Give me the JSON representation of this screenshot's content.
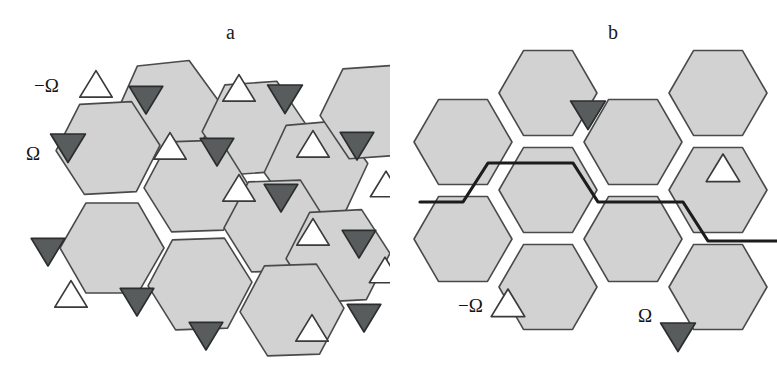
{
  "figure": {
    "width": 777,
    "height": 372,
    "background": "#ffffff"
  },
  "colors": {
    "hexagon_fill": "#d2d2d2",
    "hexagon_stroke": "#4a4a4a",
    "bold_edge_stroke": "#1c1c1c",
    "triangle_dark_fill": "#585c5c",
    "triangle_dark_stroke": "#2b2e2e",
    "triangle_light_fill": "#ffffff",
    "triangle_light_stroke": "#3a3a3a",
    "text": "#141414"
  },
  "panels": [
    {
      "id": "a",
      "label": "a",
      "label_x": 226,
      "label_y": 22,
      "legend": [
        {
          "name": "minus-omega",
          "text": "−Ω",
          "x": 34,
          "y": 88,
          "marker": "up-light"
        },
        {
          "name": "plus-omega",
          "text": "Ω",
          "x": 26,
          "y": 156,
          "marker": "down-dark"
        }
      ],
      "hexagons": [
        {
          "id": "a-h1",
          "cx": 168,
          "cy": 108,
          "r": 52,
          "rot": -6
        },
        {
          "id": "a-h2",
          "cx": 108,
          "cy": 148,
          "r": 52,
          "rot": -3
        },
        {
          "id": "a-h3",
          "cx": 254,
          "cy": 128,
          "r": 52,
          "rot": -4
        },
        {
          "id": "a-h4",
          "cx": 196,
          "cy": 186,
          "r": 52,
          "rot": -2
        },
        {
          "id": "a-h5",
          "cx": 316,
          "cy": 168,
          "r": 52,
          "rot": -5
        },
        {
          "id": "a-h6",
          "cx": 276,
          "cy": 226,
          "r": 52,
          "rot": -2
        },
        {
          "id": "a-h7",
          "cx": 112,
          "cy": 248,
          "r": 52,
          "rot": 0
        },
        {
          "id": "a-h8",
          "cx": 200,
          "cy": 284,
          "r": 52,
          "rot": -2
        },
        {
          "id": "a-h9",
          "cx": 338,
          "cy": 256,
          "r": 52,
          "rot": -3
        },
        {
          "id": "a-h10",
          "cx": 292,
          "cy": 310,
          "r": 52,
          "rot": -2
        },
        {
          "id": "a-h11",
          "cx": 372,
          "cy": 112,
          "r": 52,
          "rot": -4
        }
      ],
      "triangles": [
        {
          "id": "a-t1",
          "cx": 96,
          "cy": 86,
          "dir": "up",
          "tone": "light",
          "size": 27
        },
        {
          "id": "a-t2",
          "cx": 146,
          "cy": 98,
          "dir": "down",
          "tone": "dark",
          "size": 28
        },
        {
          "id": "a-t3",
          "cx": 239,
          "cy": 90,
          "dir": "up",
          "tone": "light",
          "size": 27
        },
        {
          "id": "a-t4",
          "cx": 285,
          "cy": 97,
          "dir": "down",
          "tone": "dark",
          "size": 29
        },
        {
          "id": "a-t5",
          "cx": 68,
          "cy": 146,
          "dir": "down",
          "tone": "dark",
          "size": 29
        },
        {
          "id": "a-t6",
          "cx": 170,
          "cy": 148,
          "dir": "up",
          "tone": "light",
          "size": 27
        },
        {
          "id": "a-t7",
          "cx": 217,
          "cy": 150,
          "dir": "down",
          "tone": "dark",
          "size": 28
        },
        {
          "id": "a-t8",
          "cx": 313,
          "cy": 146,
          "dir": "up",
          "tone": "light",
          "size": 27
        },
        {
          "id": "a-t9",
          "cx": 357,
          "cy": 144,
          "dir": "down",
          "tone": "dark",
          "size": 28
        },
        {
          "id": "a-t10",
          "cx": 239,
          "cy": 190,
          "dir": "up",
          "tone": "light",
          "size": 27
        },
        {
          "id": "a-t11",
          "cx": 281,
          "cy": 196,
          "dir": "down",
          "tone": "dark",
          "size": 28
        },
        {
          "id": "a-t12",
          "cx": 386,
          "cy": 186,
          "dir": "up",
          "tone": "light",
          "size": 26
        },
        {
          "id": "a-t13",
          "cx": 313,
          "cy": 234,
          "dir": "up",
          "tone": "light",
          "size": 27
        },
        {
          "id": "a-t14",
          "cx": 359,
          "cy": 242,
          "dir": "down",
          "tone": "dark",
          "size": 28
        },
        {
          "id": "a-t15",
          "cx": 48,
          "cy": 250,
          "dir": "down",
          "tone": "dark",
          "size": 28
        },
        {
          "id": "a-t16",
          "cx": 385,
          "cy": 272,
          "dir": "up",
          "tone": "light",
          "size": 26
        },
        {
          "id": "a-t17",
          "cx": 71,
          "cy": 296,
          "dir": "up",
          "tone": "light",
          "size": 27
        },
        {
          "id": "a-t18",
          "cx": 137,
          "cy": 300,
          "dir": "down",
          "tone": "dark",
          "size": 28
        },
        {
          "id": "a-t19",
          "cx": 364,
          "cy": 316,
          "dir": "down",
          "tone": "dark",
          "size": 28
        },
        {
          "id": "a-t20",
          "cx": 206,
          "cy": 334,
          "dir": "down",
          "tone": "dark",
          "size": 28
        },
        {
          "id": "a-t21",
          "cx": 312,
          "cy": 330,
          "dir": "up",
          "tone": "light",
          "size": 27
        }
      ]
    },
    {
      "id": "b",
      "label": "b",
      "label_x": 608,
      "label_y": 22,
      "legend": [
        {
          "name": "minus-omega",
          "text": "−Ω",
          "x": 458,
          "y": 308,
          "marker": "up-light"
        },
        {
          "name": "plus-omega",
          "text": "Ω",
          "x": 638,
          "y": 318,
          "marker": "down-dark"
        }
      ],
      "hexagons": [
        {
          "id": "b-h1",
          "cx": 463,
          "cy": 142,
          "r": 49,
          "rot": 0
        },
        {
          "id": "b-h2",
          "cx": 548,
          "cy": 93,
          "r": 49,
          "rot": 0
        },
        {
          "id": "b-h3",
          "cx": 548,
          "cy": 190,
          "r": 49,
          "rot": 0
        },
        {
          "id": "b-h4",
          "cx": 633,
          "cy": 142,
          "r": 49,
          "rot": 0
        },
        {
          "id": "b-h5",
          "cx": 718,
          "cy": 93,
          "r": 49,
          "rot": 0
        },
        {
          "id": "b-h6",
          "cx": 718,
          "cy": 190,
          "r": 49,
          "rot": 0
        },
        {
          "id": "b-h7",
          "cx": 463,
          "cy": 239,
          "r": 49,
          "rot": 0
        },
        {
          "id": "b-h8",
          "cx": 548,
          "cy": 287,
          "r": 49,
          "rot": 0
        },
        {
          "id": "b-h9",
          "cx": 633,
          "cy": 239,
          "r": 49,
          "rot": 0
        },
        {
          "id": "b-h10",
          "cx": 718,
          "cy": 287,
          "r": 49,
          "rot": 0
        }
      ],
      "bold_path": {
        "name": "dislocation-line",
        "points": "420,202 463,202 488,163 573,163 598,202 683,202 708,241 777,241"
      },
      "triangles": [
        {
          "id": "b-t1",
          "cx": 588,
          "cy": 113,
          "dir": "down",
          "tone": "dark",
          "size": 29
        },
        {
          "id": "b-t2",
          "cx": 723,
          "cy": 170,
          "dir": "up",
          "tone": "light",
          "size": 28
        },
        {
          "id": "b-t3",
          "cx": 508,
          "cy": 305,
          "dir": "up",
          "tone": "light",
          "size": 28
        },
        {
          "id": "b-t4",
          "cx": 678,
          "cy": 335,
          "dir": "down",
          "tone": "dark",
          "size": 29
        }
      ]
    }
  ]
}
